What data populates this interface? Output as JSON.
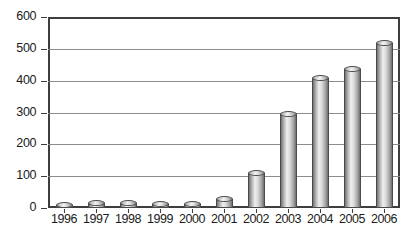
{
  "chart_data": {
    "type": "bar",
    "title": "",
    "subtitle": "",
    "xlabel": "",
    "ylabel": "",
    "categories": [
      "1996",
      "1997",
      "1998",
      "1999",
      "2000",
      "2001",
      "2002",
      "2003",
      "2004",
      "2005",
      "2006"
    ],
    "values": [
      5,
      15,
      15,
      14,
      14,
      29,
      110,
      296,
      407,
      437,
      517
    ],
    "ylim": [
      0,
      600
    ],
    "ytick_labels": [
      "0",
      "100",
      "200",
      "300",
      "400",
      "500",
      "600"
    ],
    "ytick_values": [
      0,
      100,
      200,
      300,
      400,
      500,
      600
    ],
    "grid": true,
    "grid_axis": "y",
    "legend": false,
    "legend_position": "none",
    "series": [
      {
        "name": "",
        "values": [
          5,
          15,
          15,
          14,
          14,
          29,
          110,
          296,
          407,
          437,
          517
        ]
      }
    ],
    "bar_style": "cylinder",
    "colors": {
      "bar_light": "#efefef",
      "bar_mid": "#c9c9c9",
      "bar_dark": "#6a6a6a",
      "bar_outline": "#4a4a4a",
      "gridline": "#8c8c8c",
      "axis": "#3d3d3d",
      "text": "#1a1a1a",
      "background": "#ffffff"
    }
  }
}
